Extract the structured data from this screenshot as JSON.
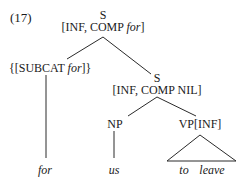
{
  "example_number": "(17)",
  "tree": {
    "root": {
      "label": "S",
      "features_prefix": "[INF, COMP ",
      "features_italic": "for",
      "features_suffix": "]"
    },
    "left_child": {
      "prefix": "{[SUBCAT ",
      "italic": "for",
      "suffix": "]}",
      "leaf": "for"
    },
    "right_child": {
      "label": "S",
      "features": "[INF, COMP NIL]"
    },
    "np": {
      "label": "NP",
      "leaf": "us"
    },
    "vp": {
      "label": "VP[INF]",
      "leaf_words": [
        "to",
        "leave"
      ]
    }
  },
  "colors": {
    "ink": "#1a1a1a",
    "background": "#ffffff"
  }
}
